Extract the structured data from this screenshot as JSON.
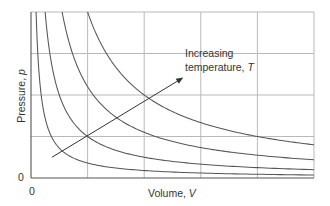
{
  "chart_data": {
    "type": "line",
    "title": "",
    "xlabel": "Volume, V",
    "ylabel": "Pressure, p",
    "x_origin_label": "0",
    "y_origin_label": "0",
    "xlim": [
      0,
      5
    ],
    "ylim": [
      0,
      4
    ],
    "grid": true,
    "x_gridlines": [
      1,
      2,
      3,
      4,
      5
    ],
    "y_gridlines": [
      1,
      2,
      3,
      4
    ],
    "legend": null,
    "annotation": {
      "text_line1": "Increasing",
      "text_line2_prefix": "temperature, ",
      "text_line2_var": "T",
      "arrow_from": [
        0.37,
        0.5
      ],
      "arrow_to": [
        2.69,
        2.42
      ]
    },
    "series": [
      {
        "name": "isotherm T1",
        "k": 0.36,
        "formula": "p = k / V"
      },
      {
        "name": "isotherm T2",
        "k": 1.0,
        "formula": "p = k / V"
      },
      {
        "name": "isotherm T3",
        "k": 2.2,
        "formula": "p = k / V"
      },
      {
        "name": "isotherm T4",
        "k": 4.0,
        "formula": "p = k / V"
      }
    ],
    "colors": {
      "curve": "#555555",
      "grid": "#b9b9b9",
      "text": "#333333"
    }
  }
}
